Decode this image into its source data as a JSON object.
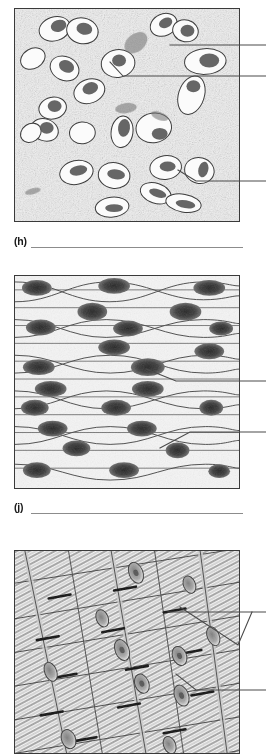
{
  "figure": {
    "kind": "histology-worksheet",
    "panel_count": 3,
    "answer_line_count": 2
  },
  "panels": [
    {
      "id": "panel-h",
      "letter": "(h)",
      "tissue_name": "areolar connective tissue",
      "alt": "Light micrograph drawing of areolar (loose) connective tissue showing scattered oval cells with dark nuclei in a speckled matrix",
      "leaders": [
        {
          "name": "leader-matrix",
          "target_structure": "matrix / ground substance"
        },
        {
          "name": "leader-nucleus",
          "target_structure": "nucleus"
        },
        {
          "name": "leader-cell",
          "target_structure": "cell"
        }
      ]
    },
    {
      "id": "panel-j",
      "letter": "(j)",
      "tissue_name": "smooth muscle tissue",
      "alt": "Light micrograph drawing of smooth muscle showing spindle-shaped fibers each with one central dark nucleus",
      "leaders": [
        {
          "name": "leader-nucleus",
          "target_structure": "nucleus"
        },
        {
          "name": "leader-smooth-fiber",
          "target_structure": "smooth muscle fiber"
        }
      ]
    },
    {
      "id": "panel-k",
      "letter": "",
      "tissue_name": "cardiac muscle tissue",
      "alt": "Light micrograph drawing of cardiac muscle showing striated branching fibers, intercalated discs and central nuclei",
      "leaders": [
        {
          "name": "leader-intercalated-disc",
          "target_structure": "intercalated disc"
        },
        {
          "name": "leader-nucleus",
          "target_structure": "nucleus"
        }
      ]
    }
  ],
  "answers": [
    {
      "label": "(h)",
      "value": ""
    },
    {
      "label": "(j)",
      "value": ""
    }
  ],
  "colors": {
    "page_background": "#ffffff",
    "panel_border": "#3a3a3a",
    "leader_line": "#4a4a4a",
    "answer_line": "#8c8c8c",
    "label_text": "#1a1a1a",
    "tissue_light": "#f2f2f2",
    "tissue_mid": "#b8b8b8",
    "tissue_dark": "#4f4f4f"
  }
}
